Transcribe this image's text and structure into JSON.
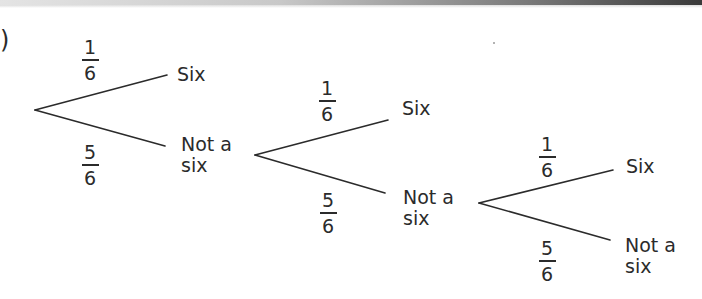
{
  "figure": {
    "part_marker": ")",
    "type": "probability tree diagram",
    "stages": [
      {
        "stage": 1,
        "branches": [
          {
            "probability": {
              "numerator": "1",
              "denominator": "6"
            },
            "outcome": [
              "Six"
            ]
          },
          {
            "probability": {
              "numerator": "5",
              "denominator": "6"
            },
            "outcome": [
              "Not a",
              "six"
            ]
          }
        ]
      },
      {
        "stage": 2,
        "branches": [
          {
            "probability": {
              "numerator": "1",
              "denominator": "6"
            },
            "outcome": [
              "Six"
            ]
          },
          {
            "probability": {
              "numerator": "5",
              "denominator": "6"
            },
            "outcome": [
              "Not a",
              "six"
            ]
          }
        ]
      },
      {
        "stage": 3,
        "branches": [
          {
            "probability": {
              "numerator": "1",
              "denominator": "6"
            },
            "outcome": [
              "Six"
            ]
          },
          {
            "probability": {
              "numerator": "5",
              "denominator": "6"
            },
            "outcome": [
              "Not a",
              "six"
            ]
          }
        ]
      }
    ],
    "colors": {
      "ink": "#2b2b2b",
      "background": "#ffffff"
    }
  }
}
